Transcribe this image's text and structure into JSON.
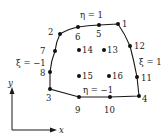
{
  "diagram": {
    "type": "quadrilateral finite element (16-node cubic)",
    "edge_color": "#1a1a1a",
    "node_color": "#111111",
    "edges": {
      "top": "η = 1",
      "bottom": "η = −1",
      "left": "ξ = −1",
      "right": "ξ = 1"
    },
    "nodes": [
      {
        "id": "1",
        "x": 118,
        "y": 24
      },
      {
        "id": "2",
        "x": 60,
        "y": 34
      },
      {
        "id": "3",
        "x": 50,
        "y": 89
      },
      {
        "id": "4",
        "x": 139,
        "y": 96
      },
      {
        "id": "5",
        "x": 99,
        "y": 25
      },
      {
        "id": "6",
        "x": 78,
        "y": 27
      },
      {
        "id": "7",
        "x": 55,
        "y": 51
      },
      {
        "id": "8",
        "x": 50,
        "y": 72
      },
      {
        "id": "9",
        "x": 79,
        "y": 97
      },
      {
        "id": "10",
        "x": 110,
        "y": 97
      },
      {
        "id": "11",
        "x": 137,
        "y": 77
      },
      {
        "id": "12",
        "x": 130,
        "y": 46
      },
      {
        "id": "13",
        "x": 104,
        "y": 50
      },
      {
        "id": "14",
        "x": 79,
        "y": 50
      },
      {
        "id": "15",
        "x": 79,
        "y": 76
      },
      {
        "id": "16",
        "x": 109,
        "y": 76
      }
    ],
    "axes": {
      "x_label": "x",
      "y_label": "y"
    }
  }
}
